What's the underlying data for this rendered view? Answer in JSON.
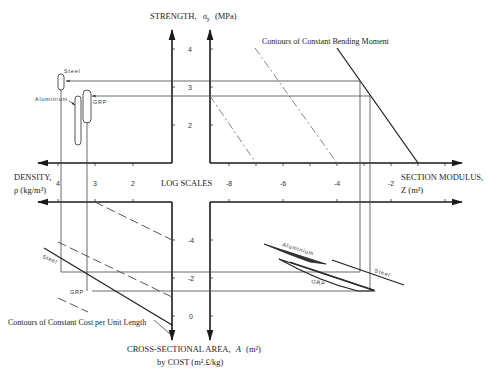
{
  "diagram": {
    "axes": {
      "strength": {
        "label": "STRENGTH,",
        "symbol": "σ",
        "subscript": "y",
        "unit": "(MPa)",
        "ticks": [
          "4",
          "3",
          "2"
        ]
      },
      "density": {
        "label": "DENSITY,",
        "unit_line": "ρ (kg/m³)",
        "ticks": [
          "4",
          "3",
          "2"
        ]
      },
      "section_modulus": {
        "label": "SECTION MODULUS,",
        "unit_line": "Z (m³)",
        "ticks": [
          "-8",
          "-6",
          "-4",
          "-2"
        ]
      },
      "area": {
        "label": "CROSS-SECTIONAL AREA,",
        "symbol": "A",
        "unit": "(m²)",
        "line2": "by COST (m².£/kg)",
        "ticks": [
          "-4",
          "-2",
          "0"
        ]
      }
    },
    "center_label": "LOG SCALES",
    "annotations": {
      "bending": "Contours of Constant Bending Moment",
      "cost": "Contours of Constant Cost per Unit Length"
    },
    "materials": {
      "steel": "Steel",
      "aluminium": "Aluminium",
      "grp": "GRP"
    },
    "bottom_right_materials": {
      "aluminium": "Aluminium",
      "grp": "GRP",
      "steel": "Steel"
    },
    "bottom_left_materials": {
      "steel": "Steel",
      "grp": "GRP"
    }
  }
}
